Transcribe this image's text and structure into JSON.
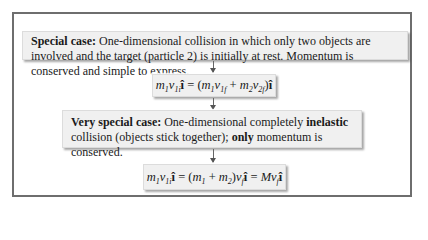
{
  "diagram": {
    "box1": {
      "bold_lead": "Special case:",
      "text": " One-dimensional collision in which only two objects are involved and the target (particle 2) is initially at rest. Momentum is conserved and simple to express."
    },
    "eq1": {
      "lhs": "m₁v₁ᵢî",
      "rhs": "(m₁v₁f + m₂v₂f)î",
      "full": "m1 v1i î = (m1 v1f + m2 v2f) î"
    },
    "box2": {
      "bold_lead": "Very special case:",
      "text_a": " One-dimensional completely ",
      "bold_mid": "inelastic",
      "text_b": " collision (objects stick together); ",
      "bold_only": "only",
      "text_c": " momentum is conserved."
    },
    "eq2": {
      "full": "m1 v1i î = (m1 + m2) vf î = M vf î"
    },
    "colors": {
      "card_bg": "#f0f0f0",
      "border": "#6e6e6e"
    }
  }
}
